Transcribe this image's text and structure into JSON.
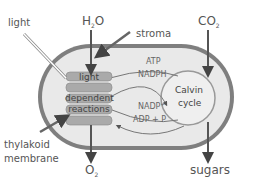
{
  "labels": {
    "light": "light",
    "water": "H",
    "water_sub": "2",
    "water_tail": "O",
    "stroma": "stroma",
    "co2": "CO",
    "co2_sub": "2",
    "thylakoid_line1": "thylakoid",
    "thylakoid_line2": "membrane",
    "oxygen": "O",
    "oxygen_sub": "2",
    "sugars": "sugars"
  },
  "light_dependent": {
    "line1": "light",
    "line2": "dependent",
    "line3": "reactions"
  },
  "calvin": {
    "line1": "Calvin",
    "line2": "cycle"
  },
  "flows": {
    "atp": "ATP",
    "nadph": "NADPH",
    "nadp": "NADP⁺",
    "adp": "ADP + P"
  },
  "colors": {
    "stroma_fill": "#e8e8e8",
    "membrane": "#8a8a8a",
    "thylakoid": "#a9a9a9",
    "calvin_fill": "#ececec",
    "text": "#555555"
  }
}
